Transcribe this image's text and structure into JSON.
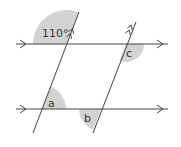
{
  "diagram": {
    "colors": {
      "line": "#444444",
      "shade": "#d3d3d3",
      "text": "#333333",
      "background": "#ffffff"
    },
    "angles": {
      "given": {
        "label": "110°",
        "position": "top-left, above top line, left of left transversal"
      },
      "a": {
        "label": "a",
        "position": "above bottom line, right of left transversal"
      },
      "b": {
        "label": "b",
        "position": "below bottom line, left of right transversal"
      },
      "c": {
        "label": "c",
        "position": "below top line, right of right transversal"
      }
    },
    "parallel_markers": {
      "horizontal_lines": "single arrow",
      "transversals": "double arrow"
    }
  }
}
